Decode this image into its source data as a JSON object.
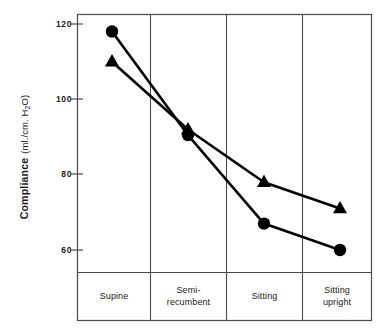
{
  "chart_data": {
    "type": "line",
    "title": "",
    "xlabel": "",
    "ylabel": "Compliance (ml./cm. H2O)",
    "ylabel_main": "Compliance",
    "ylabel_units": "(ml./cm. H",
    "ylabel_units_sub": "2",
    "ylabel_units_tail": "O)",
    "categories": [
      "Supine",
      "Semi-\nrecumbent",
      "Sitting",
      "Sitting\nupright"
    ],
    "category_lines": [
      [
        "Supine"
      ],
      [
        "Semi-",
        "recumbent"
      ],
      [
        "Sitting"
      ],
      [
        "Sitting",
        "upright"
      ]
    ],
    "yticks": [
      120,
      100,
      80,
      60
    ],
    "ytick_labels": [
      "120",
      "100",
      "80",
      "60"
    ],
    "ylim": [
      54,
      124
    ],
    "grid": false,
    "legend": "none",
    "series": [
      {
        "name": "circle-series",
        "marker": "circle",
        "color": "#000000",
        "values": [
          118,
          90.5,
          67,
          60
        ]
      },
      {
        "name": "triangle-series",
        "marker": "triangle",
        "color": "#000000",
        "values": [
          110,
          92,
          78,
          71
        ]
      }
    ]
  },
  "figure": {
    "frame_color": "#4a4a4a",
    "line_color": "#000000",
    "background": "#ffffff"
  }
}
